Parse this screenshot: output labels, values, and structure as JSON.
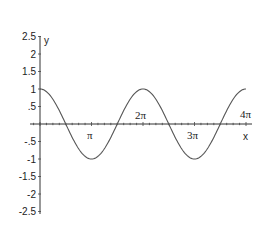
{
  "chart_data": {
    "type": "line",
    "title": "",
    "function": "y = cos(x)",
    "xlabel": "x",
    "ylabel": "y",
    "xlim": [
      0,
      12.566
    ],
    "ylim": [
      -2.5,
      2.5
    ],
    "grid": false,
    "legend": null,
    "x_ticks": [
      {
        "value": 3.1416,
        "label": "π"
      },
      {
        "value": 6.2832,
        "label": "2π"
      },
      {
        "value": 9.4248,
        "label": "3π"
      },
      {
        "value": 12.566,
        "label": "4π"
      }
    ],
    "y_ticks": [
      {
        "value": 2.5,
        "label": "2.5"
      },
      {
        "value": 2,
        "label": "2"
      },
      {
        "value": 1.5,
        "label": "1.5"
      },
      {
        "value": 1,
        "label": "1"
      },
      {
        "value": 0.5,
        "label": ".5"
      },
      {
        "value": -0.5,
        "label": "-.5"
      },
      {
        "value": -1,
        "label": "-1"
      },
      {
        "value": -1.5,
        "label": "-1.5"
      },
      {
        "value": -2,
        "label": "-2"
      },
      {
        "value": -2.5,
        "label": "-2.5"
      }
    ],
    "series": [
      {
        "name": "cos(x)",
        "x": [
          0,
          1.5708,
          3.1416,
          4.7124,
          6.2832,
          7.854,
          9.4248,
          10.9956,
          12.566
        ],
        "values": [
          1,
          0,
          -1,
          0,
          1,
          0,
          -1,
          0,
          1
        ]
      }
    ],
    "annotations": [
      {
        "text": "π",
        "near": "first zero crossing",
        "position": "below axis"
      },
      {
        "text": "2π",
        "position": "above axis"
      },
      {
        "text": "3π",
        "position": "below axis"
      },
      {
        "text": "4π",
        "position": "above axis"
      },
      {
        "text": "x",
        "position": "below axis right end"
      }
    ]
  },
  "labels": {
    "x_axis_name": "x",
    "y_axis_name": "y",
    "pi": "π",
    "two_pi": "2π",
    "three_pi": "3π",
    "four_pi": "4π"
  },
  "colors": {
    "line": "#555555",
    "axis": "#333333",
    "background": "#ffffff"
  }
}
